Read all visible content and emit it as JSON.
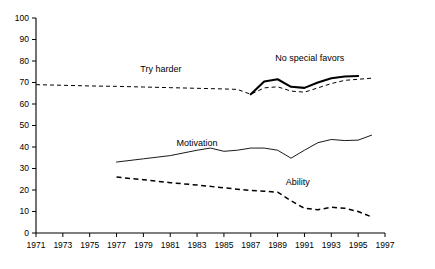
{
  "chart_data": {
    "type": "line",
    "title": "",
    "subtitle": "",
    "xlabel": "",
    "ylabel": "",
    "xlim": [
      1971,
      1997
    ],
    "ylim": [
      0,
      100
    ],
    "grid": false,
    "legend_position": "inline-annotations",
    "y_ticks": [
      0,
      10,
      20,
      30,
      40,
      50,
      60,
      70,
      80,
      90,
      100
    ],
    "y_tick_labels": [
      "0",
      "10",
      "20",
      "30",
      "40",
      "50",
      "60",
      "70",
      "80",
      "90",
      "100"
    ],
    "x_ticks": [
      1971,
      1973,
      1975,
      1977,
      1979,
      1981,
      1983,
      1985,
      1987,
      1989,
      1991,
      1993,
      1995,
      1997
    ],
    "x_tick_labels": [
      "1971",
      "1973",
      "1975",
      "1977",
      "1979",
      "1981",
      "1983",
      "1985",
      "1987",
      "1989",
      "1991",
      "1993",
      "1995",
      "1997"
    ],
    "series": [
      {
        "name": "Try harder",
        "style": "dashed",
        "label_x": 1980.3,
        "label_y": 76,
        "x": [
          1971,
          1973,
          1975,
          1977,
          1979,
          1981,
          1983,
          1985,
          1986,
          1987,
          1988,
          1989,
          1990,
          1991,
          1992,
          1993,
          1994,
          1995,
          1996
        ],
        "values": [
          69,
          68.7,
          68.4,
          68.2,
          67.9,
          67.6,
          67.3,
          67.0,
          66.8,
          64.5,
          67.5,
          68.0,
          66.0,
          65.5,
          67.5,
          69.5,
          71.0,
          71.5,
          72.0
        ]
      },
      {
        "name": "No special favors",
        "style": "thick-solid",
        "label_x": 1991.4,
        "label_y": 81,
        "x": [
          1987,
          1988,
          1989,
          1990,
          1991,
          1992,
          1993,
          1994,
          1995
        ],
        "values": [
          64.5,
          70.5,
          71.5,
          68.0,
          67.5,
          70.0,
          72.0,
          72.8,
          73.0
        ]
      },
      {
        "name": "Motivation",
        "style": "solid",
        "label_x": 1983.0,
        "label_y": 41.5,
        "x": [
          1977,
          1979,
          1981,
          1983,
          1984,
          1985,
          1986,
          1987,
          1988,
          1989,
          1990,
          1991,
          1992,
          1993,
          1994,
          1995,
          1996
        ],
        "values": [
          33.0,
          34.5,
          36.0,
          38.5,
          39.5,
          38.0,
          38.5,
          39.5,
          39.5,
          38.5,
          34.8,
          38.5,
          42.0,
          43.5,
          43.0,
          43.2,
          45.5
        ]
      },
      {
        "name": "Ability",
        "style": "dashed-heavy",
        "label_x": 1990.5,
        "label_y": 23.5,
        "x": [
          1977,
          1979,
          1981,
          1983,
          1985,
          1987,
          1988,
          1989,
          1990,
          1991,
          1992,
          1993,
          1994,
          1995,
          1996
        ],
        "values": [
          26.0,
          24.8,
          23.4,
          22.3,
          21.0,
          19.8,
          19.4,
          19.0,
          15.0,
          11.5,
          10.8,
          12.0,
          11.5,
          10.0,
          7.5
        ]
      }
    ]
  }
}
